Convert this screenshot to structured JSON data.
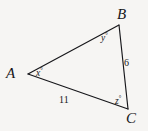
{
  "figure": {
    "type": "triangle-diagram",
    "background_color": "#f6f5f3",
    "stroke_color": "#16161a",
    "vertices": [
      {
        "name": "A",
        "label": "A",
        "x": 28,
        "y": 74
      },
      {
        "name": "B",
        "label": "B",
        "x": 119,
        "y": 25
      },
      {
        "name": "C",
        "label": "C",
        "x": 128,
        "y": 109
      }
    ],
    "angle_labels": [
      {
        "at": "A",
        "text": "x",
        "degree_symbol": "°"
      },
      {
        "at": "B",
        "text": "y",
        "degree_symbol": "°"
      },
      {
        "at": "C",
        "text": "z",
        "degree_symbol": "°"
      }
    ],
    "side_labels": [
      {
        "side": "BC",
        "text": "6"
      },
      {
        "side": "AC",
        "text": "11"
      }
    ]
  },
  "labels": {
    "vertex_a": "A",
    "vertex_b": "B",
    "vertex_c": "C",
    "angle_x": "x",
    "angle_y": "y",
    "angle_z": "z",
    "degree": "°",
    "side_bc": "6",
    "side_ac": "11"
  }
}
